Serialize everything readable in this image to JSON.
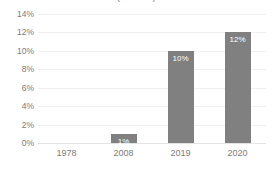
{
  "chart_data": {
    "type": "bar",
    "title": "(Percent)",
    "xlabel": "",
    "ylabel": "",
    "categories": [
      "1978",
      "2008",
      "2019",
      "2020"
    ],
    "values": [
      0,
      1,
      10,
      12
    ],
    "data_labels": [
      "",
      "1%",
      "10%",
      "12%"
    ],
    "ylim": [
      0,
      14
    ],
    "ytick_values": [
      14,
      12,
      10,
      8,
      6,
      4,
      2,
      0
    ],
    "ytick_labels": [
      "14%",
      "12%",
      "10%",
      "8%",
      "6%",
      "4%",
      "2%",
      "0%"
    ],
    "grid": true,
    "legend": false,
    "series": [
      {
        "name": "Percent",
        "values": [
          0,
          1,
          10,
          12
        ]
      }
    ],
    "colors": {
      "bar": "#808080",
      "gridline": "#f0f0f0",
      "baseline": "#e3e3e3",
      "axis_text": "#7b7b7b",
      "data_label_text": "#ffffff",
      "background": "#ffffff"
    }
  }
}
